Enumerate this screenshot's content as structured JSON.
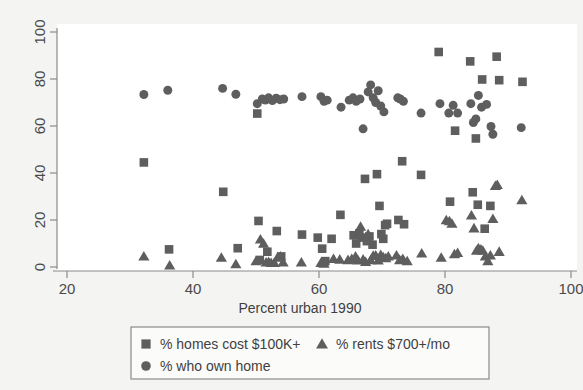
{
  "chart_data": {
    "type": "scatter",
    "title": "",
    "xlabel": "Percent urban 1990",
    "ylabel": "",
    "xlim": [
      20,
      100
    ],
    "ylim": [
      0,
      100
    ],
    "xticks": [
      20,
      40,
      60,
      80,
      100
    ],
    "yticks": [
      0,
      20,
      40,
      60,
      80,
      100
    ],
    "xtick_labels": [
      "20",
      "40",
      "60",
      "80",
      "100"
    ],
    "ytick_labels": [
      "0",
      "20",
      "40",
      "60",
      "80",
      "100"
    ],
    "grid": false,
    "legend_position": "below-axis",
    "marker_color": "#5e5e5e",
    "axis_color": "#8a8a8a",
    "background_color": "#f4f4f2",
    "plot_background_color": "#ffffff",
    "series": [
      {
        "name": "% homes cost $100K+",
        "marker": "square",
        "color": "#5e5e5e",
        "points": [
          [
            32.2,
            44.5
          ],
          [
            36.2,
            7.5
          ],
          [
            44.8,
            32.0
          ],
          [
            47.1,
            8.0
          ],
          [
            50.2,
            65.3
          ],
          [
            50.4,
            19.6
          ],
          [
            50.6,
            3.0
          ],
          [
            51.8,
            6.5
          ],
          [
            53.3,
            15.3
          ],
          [
            54.0,
            4.5
          ],
          [
            57.3,
            13.8
          ],
          [
            59.8,
            12.5
          ],
          [
            60.5,
            7.8
          ],
          [
            61.0,
            2.5
          ],
          [
            62.0,
            12.0
          ],
          [
            63.4,
            22.2
          ],
          [
            65.5,
            13.5
          ],
          [
            65.9,
            10.0
          ],
          [
            66.4,
            14.3
          ],
          [
            66.8,
            12.5
          ],
          [
            67.3,
            37.5
          ],
          [
            67.6,
            11.0
          ],
          [
            68.0,
            13.0
          ],
          [
            68.5,
            9.5
          ],
          [
            69.2,
            39.5
          ],
          [
            69.6,
            26.0
          ],
          [
            69.9,
            14.0
          ],
          [
            70.2,
            12.0
          ],
          [
            70.5,
            17.8
          ],
          [
            70.8,
            18.4
          ],
          [
            72.6,
            20.0
          ],
          [
            73.2,
            45.0
          ],
          [
            73.5,
            18.2
          ],
          [
            76.2,
            39.2
          ],
          [
            79.0,
            91.5
          ],
          [
            80.8,
            27.8
          ],
          [
            81.6,
            58.0
          ],
          [
            84.0,
            87.5
          ],
          [
            84.4,
            31.8
          ],
          [
            84.9,
            54.7
          ],
          [
            85.2,
            26.5
          ],
          [
            85.9,
            79.8
          ],
          [
            86.3,
            16.3
          ],
          [
            87.2,
            26.0
          ],
          [
            88.2,
            89.5
          ],
          [
            88.6,
            79.5
          ],
          [
            92.3,
            78.8
          ]
        ]
      },
      {
        "name": "% rents $700+/mo",
        "marker": "triangle",
        "color": "#5e5e5e",
        "points": [
          [
            32.2,
            4.5
          ],
          [
            36.3,
            0.7
          ],
          [
            44.5,
            4.0
          ],
          [
            46.8,
            1.2
          ],
          [
            50.0,
            2.5
          ],
          [
            50.7,
            11.8
          ],
          [
            51.2,
            10.0
          ],
          [
            51.6,
            2.0
          ],
          [
            52.0,
            2.2
          ],
          [
            52.4,
            1.8
          ],
          [
            52.9,
            1.8
          ],
          [
            53.4,
            4.0
          ],
          [
            53.9,
            4.5
          ],
          [
            54.3,
            2.0
          ],
          [
            57.2,
            2.0
          ],
          [
            60.3,
            1.8
          ],
          [
            60.8,
            1.5
          ],
          [
            62.3,
            3.5
          ],
          [
            63.3,
            3.2
          ],
          [
            64.6,
            3.0
          ],
          [
            65.2,
            3.5
          ],
          [
            65.8,
            4.5
          ],
          [
            66.2,
            2.8
          ],
          [
            66.6,
            17.2
          ],
          [
            67.0,
            3.2
          ],
          [
            67.4,
            2.2
          ],
          [
            67.8,
            14.0
          ],
          [
            68.2,
            3.0
          ],
          [
            68.6,
            4.8
          ],
          [
            69.0,
            5.0
          ],
          [
            69.4,
            2.8
          ],
          [
            69.8,
            5.2
          ],
          [
            70.2,
            4.2
          ],
          [
            70.6,
            3.8
          ],
          [
            71.0,
            4.5
          ],
          [
            72.3,
            5.0
          ],
          [
            72.8,
            3.0
          ],
          [
            73.3,
            3.5
          ],
          [
            74.0,
            2.5
          ],
          [
            76.3,
            5.8
          ],
          [
            79.4,
            4.0
          ],
          [
            80.2,
            20.0
          ],
          [
            80.7,
            19.5
          ],
          [
            81.1,
            18.5
          ],
          [
            81.5,
            5.5
          ],
          [
            82.0,
            6.0
          ],
          [
            84.2,
            22.0
          ],
          [
            84.6,
            16.5
          ],
          [
            85.0,
            7.0
          ],
          [
            85.3,
            8.0
          ],
          [
            85.7,
            7.5
          ],
          [
            86.0,
            7.0
          ],
          [
            86.4,
            4.5
          ],
          [
            86.8,
            2.5
          ],
          [
            87.2,
            5.0
          ],
          [
            87.6,
            20.5
          ],
          [
            88.0,
            34.5
          ],
          [
            88.3,
            35.0
          ],
          [
            88.6,
            6.5
          ],
          [
            92.2,
            28.5
          ]
        ]
      },
      {
        "name": "% who own home",
        "marker": "circle",
        "color": "#5e5e5e",
        "points": [
          [
            32.2,
            73.4
          ],
          [
            36.0,
            75.2
          ],
          [
            44.7,
            76.0
          ],
          [
            46.8,
            73.5
          ],
          [
            50.2,
            69.5
          ],
          [
            51.0,
            71.5
          ],
          [
            51.5,
            71.0
          ],
          [
            52.0,
            72.0
          ],
          [
            52.6,
            70.8
          ],
          [
            53.2,
            71.8
          ],
          [
            53.8,
            71.2
          ],
          [
            54.4,
            71.5
          ],
          [
            57.3,
            72.5
          ],
          [
            60.3,
            72.5
          ],
          [
            60.8,
            70.5
          ],
          [
            61.3,
            71.0
          ],
          [
            63.5,
            68.0
          ],
          [
            64.8,
            71.0
          ],
          [
            65.4,
            72.0
          ],
          [
            65.9,
            70.5
          ],
          [
            66.5,
            71.5
          ],
          [
            67.0,
            58.8
          ],
          [
            67.8,
            74.5
          ],
          [
            68.2,
            77.5
          ],
          [
            68.6,
            72.0
          ],
          [
            69.0,
            70.0
          ],
          [
            69.4,
            75.0
          ],
          [
            69.8,
            68.5
          ],
          [
            70.3,
            66.0
          ],
          [
            72.5,
            72.0
          ],
          [
            72.9,
            71.5
          ],
          [
            73.4,
            70.5
          ],
          [
            76.2,
            65.5
          ],
          [
            79.2,
            69.5
          ],
          [
            80.6,
            65.5
          ],
          [
            81.3,
            68.8
          ],
          [
            82.0,
            65.5
          ],
          [
            84.1,
            69.5
          ],
          [
            84.5,
            61.5
          ],
          [
            84.9,
            63.0
          ],
          [
            85.3,
            73.0
          ],
          [
            85.8,
            68.0
          ],
          [
            86.6,
            69.2
          ],
          [
            87.3,
            59.8
          ],
          [
            87.6,
            56.5
          ],
          [
            92.1,
            59.3
          ]
        ]
      }
    ]
  },
  "axes": {
    "x": {
      "title": "Percent urban 1990",
      "ticks": [
        "20",
        "40",
        "60",
        "80",
        "100"
      ]
    },
    "y": {
      "ticks": [
        "0",
        "20",
        "40",
        "60",
        "80",
        "100"
      ]
    }
  },
  "legend": {
    "entries": [
      {
        "label": "% homes cost $100K+",
        "marker": "square-marker"
      },
      {
        "label": "% rents $700+/mo",
        "marker": "triangle-marker"
      },
      {
        "label": "% who own home",
        "marker": "circle-marker"
      }
    ]
  }
}
